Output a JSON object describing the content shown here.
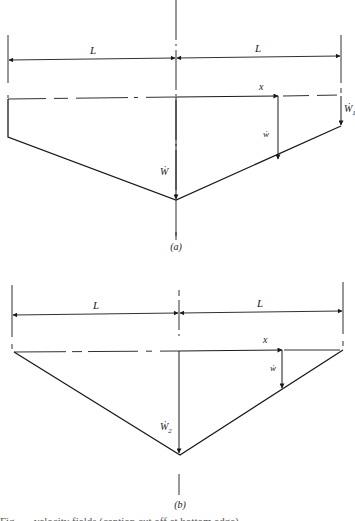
{
  "figure": {
    "panels": [
      {
        "id": "a",
        "label": "(a)",
        "dimension_left": "L",
        "dimension_right": "L",
        "axis_label": "x",
        "center_velocity_label": "Ẇ",
        "local_velocity_label": "ẇ",
        "tip_velocity_label": "Ẇ",
        "tip_velocity_subscript": "1",
        "shape": "trapezoid (tips displaced, center displaced more)"
      },
      {
        "id": "b",
        "label": "(b)",
        "dimension_left": "L",
        "dimension_right": "L",
        "axis_label": "x",
        "center_velocity_label": "Ẇ",
        "center_velocity_subscript": "2",
        "local_velocity_label": "ẇ",
        "shape": "triangle (tips fixed, center displaced)"
      }
    ],
    "colors": {
      "ink": "#1a1a1a",
      "background": "#ffffff"
    },
    "caption_partial": "Fig. — velocity fields (caption cut off at bottom edge)"
  }
}
